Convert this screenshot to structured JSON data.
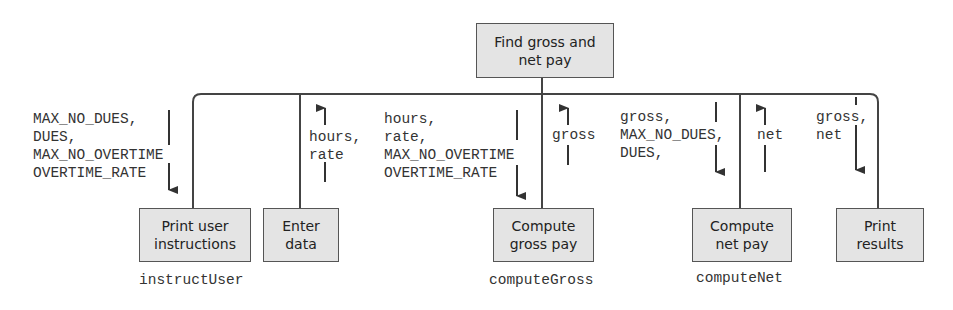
{
  "root": {
    "label": "Find gross and\nnet pay"
  },
  "modules": [
    {
      "label": "Print user\ninstructions",
      "function_name": "instructUser"
    },
    {
      "label": "Enter\ndata",
      "function_name": ""
    },
    {
      "label": "Compute\ngross pay",
      "function_name": "computeGross"
    },
    {
      "label": "Compute\nnet pay",
      "function_name": "computeNet"
    },
    {
      "label": "Print\nresults",
      "function_name": ""
    }
  ],
  "data_flows": [
    {
      "to_module": "Print user instructions",
      "direction": "down",
      "text": "MAX_NO_DUES,\nDUES,\nMAX_NO_OVERTIME\nOVERTIME_RATE"
    },
    {
      "from_module": "Enter data",
      "direction": "up",
      "text": "hours,\nrate"
    },
    {
      "to_module": "Compute gross pay",
      "direction": "down",
      "text": "hours,\nrate,\nMAX_NO_OVERTIME\nOVERTIME_RATE"
    },
    {
      "from_module": "Compute gross pay",
      "direction": "up",
      "text": "gross"
    },
    {
      "to_module": "Compute net pay",
      "direction": "down",
      "text": "gross,\nMAX_NO_DUES,\nDUES,"
    },
    {
      "from_module": "Compute net pay",
      "direction": "up",
      "text": "net"
    },
    {
      "to_module": "Print results",
      "direction": "down",
      "text": "gross,\nnet"
    }
  ],
  "colors": {
    "box_fill": "#e4e4e4",
    "box_border": "#555555",
    "line": "#444444",
    "text": "#333333"
  }
}
